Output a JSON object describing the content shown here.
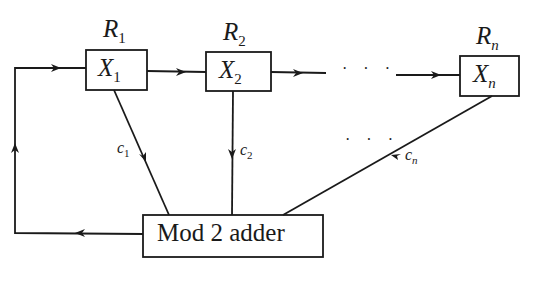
{
  "diagram": {
    "type": "linear feedback shift register",
    "registers": [
      {
        "reg_label": "R",
        "reg_sub": "1",
        "cell_label": "X",
        "cell_sub": "1",
        "coef": "c",
        "coef_sub": "1"
      },
      {
        "reg_label": "R",
        "reg_sub": "2",
        "cell_label": "X",
        "cell_sub": "2",
        "coef": "c",
        "coef_sub": "2"
      },
      {
        "reg_label": "R",
        "reg_sub": "n",
        "cell_label": "X",
        "cell_sub": "n",
        "coef": "c",
        "coef_sub": "n"
      }
    ],
    "ellipsis": "· · ·",
    "adder_label": "Mod 2 adder",
    "line_color": "#1a1a1a"
  }
}
